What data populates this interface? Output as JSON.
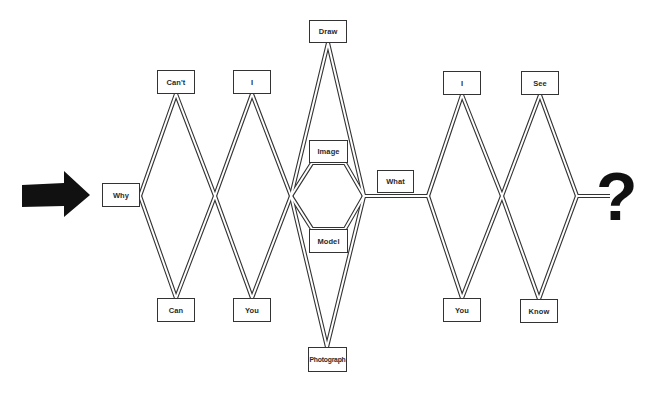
{
  "colors": {
    "background": "#ffffff",
    "line": "#333333",
    "arrow": "#111111",
    "text": "#2a2a2a"
  },
  "entry_arrow": {
    "icon": "right-arrow-icon"
  },
  "nodes": {
    "why": {
      "label": "Why",
      "x": 102,
      "y": 183,
      "w": 38,
      "h": 24
    },
    "cant": {
      "label": "Can't",
      "x": 157,
      "y": 70,
      "w": 38,
      "h": 24
    },
    "can": {
      "label": "Can",
      "x": 157,
      "y": 298,
      "w": 38,
      "h": 24
    },
    "i_left": {
      "label": "I",
      "x": 233,
      "y": 70,
      "w": 38,
      "h": 24
    },
    "you_left": {
      "label": "You",
      "x": 233,
      "y": 298,
      "w": 38,
      "h": 24
    },
    "draw": {
      "label": "Draw",
      "x": 309,
      "y": 20,
      "w": 38,
      "h": 23
    },
    "image": {
      "label": "Image",
      "x": 309,
      "y": 140,
      "w": 39,
      "h": 23
    },
    "model": {
      "label": "Model",
      "x": 309,
      "y": 229,
      "w": 39,
      "h": 24
    },
    "photograph": {
      "label": "Photograph",
      "x": 308,
      "y": 347,
      "w": 39,
      "h": 25
    },
    "what": {
      "label": "What",
      "x": 377,
      "y": 170,
      "w": 37,
      "h": 23
    },
    "i_right": {
      "label": "I",
      "x": 443,
      "y": 71,
      "w": 38,
      "h": 24
    },
    "you_right": {
      "label": "You",
      "x": 443,
      "y": 298,
      "w": 38,
      "h": 24
    },
    "see": {
      "label": "See",
      "x": 521,
      "y": 71,
      "w": 38,
      "h": 24
    },
    "know": {
      "label": "Know",
      "x": 520,
      "y": 299,
      "w": 38,
      "h": 24
    }
  },
  "terminal": {
    "symbol": "?",
    "icon": "question-mark-icon"
  }
}
